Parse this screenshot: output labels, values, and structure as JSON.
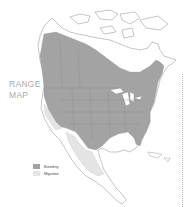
{
  "title": {
    "line1": "RANGE",
    "line2": "MAP"
  },
  "legend": {
    "items": [
      {
        "label": "Breeding",
        "color": "#a3a3a3"
      },
      {
        "label": "Migration",
        "color": "#e4e4e4"
      }
    ]
  },
  "colors": {
    "land": "#ffffff",
    "outline": "#8a8a8a",
    "breeding": "#a3a3a3",
    "migration": "#e4e4e4",
    "water": "#ffffff"
  }
}
